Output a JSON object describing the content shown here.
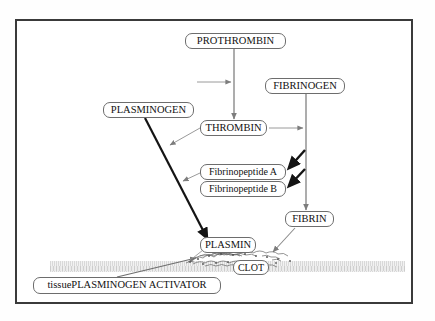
{
  "diagram": {
    "nodes": {
      "prothrombin": "PROTHROMBIN",
      "fibrinogen": "FIBRINOGEN",
      "plasminogen": "PLASMINOGEN",
      "thrombin": "THROMBIN",
      "fibrinopeptide_a": "Fibrinopeptide A",
      "fibrinopeptide_b": "Fibrinopeptide B",
      "fibrin": "FIBRIN",
      "plasmin": "PLASMIN",
      "clot": "CLOT",
      "tpa_lower": "tissue ",
      "tpa_upper": "PLASMINOGEN ACTIVATOR"
    },
    "colors": {
      "frame": "#3a3a3a",
      "node_border": "#6d6d6d",
      "node_fill": "#ffffff",
      "thin_arrow": "#8f8f8f",
      "thick_arrow": "#1a1a1a",
      "vessel_wall": "#d8d8d8",
      "text": "#111111"
    },
    "edges": [
      {
        "from": "prothrombin",
        "to": "thrombin",
        "style": "thin-vertical"
      },
      {
        "from": "activator-left",
        "to": "prothrombin-thrombin-line",
        "style": "thin-horizontal"
      },
      {
        "from": "fibrinogen",
        "to": "fibrin",
        "style": "thin-vertical"
      },
      {
        "from": "thrombin",
        "to": "fibrinogen-fibrin-line",
        "style": "thin-horizontal"
      },
      {
        "from": "fibrinogen-fibrin-line",
        "to": "fibrinopeptide_a",
        "style": "thick-diagonal"
      },
      {
        "from": "fibrinogen-fibrin-line",
        "to": "fibrinopeptide_b",
        "style": "thick-diagonal"
      },
      {
        "from": "plasminogen",
        "to": "plasmin",
        "style": "thick-diagonal"
      },
      {
        "from": "thrombin",
        "to": "plasminogen-plasmin-line",
        "style": "thin-diagonal"
      },
      {
        "from": "fibrinopeptide_a",
        "to": "plasminogen-plasmin-line",
        "style": "thin-diagonal"
      },
      {
        "from": "fibrin",
        "to": "clot",
        "style": "thin-diagonal"
      },
      {
        "from": "tissue_plasminogen_activator",
        "to": "clot",
        "style": "thin-diagonal"
      },
      {
        "from": "plasmin",
        "to": "clot",
        "style": "thin-diagonal"
      }
    ]
  }
}
